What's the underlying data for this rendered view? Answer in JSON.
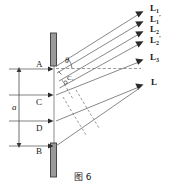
{
  "figure": {
    "caption": "图 6",
    "angle_label": "θ",
    "dimension_label": "a",
    "rays": [
      {
        "id": "L1",
        "base": "L",
        "sub": "1",
        "prime": "",
        "text": "L₁"
      },
      {
        "id": "L1p",
        "base": "L",
        "sub": "1",
        "prime": "′",
        "text": "L₁′"
      },
      {
        "id": "L2",
        "base": "L",
        "sub": "2",
        "prime": "",
        "text": "L₂"
      },
      {
        "id": "L2p",
        "base": "L",
        "sub": "2",
        "prime": "′",
        "text": "L₂′"
      },
      {
        "id": "L3",
        "base": "L",
        "sub": "3",
        "prime": "",
        "text": "L₃"
      },
      {
        "id": "L",
        "base": "L",
        "sub": "",
        "prime": "",
        "text": "L"
      }
    ],
    "points": [
      {
        "id": "A",
        "label": "A"
      },
      {
        "id": "C1",
        "label": "C₁"
      },
      {
        "id": "C",
        "label": "C"
      },
      {
        "id": "D",
        "label": "D"
      },
      {
        "id": "B",
        "label": "B"
      }
    ],
    "colors": {
      "line": "#4a4a4a",
      "bar_fill": "#9a9a9a",
      "bar_stroke": "#3a3a3a",
      "text": "#1a1a1a",
      "dash": "#6e6e6e"
    }
  }
}
